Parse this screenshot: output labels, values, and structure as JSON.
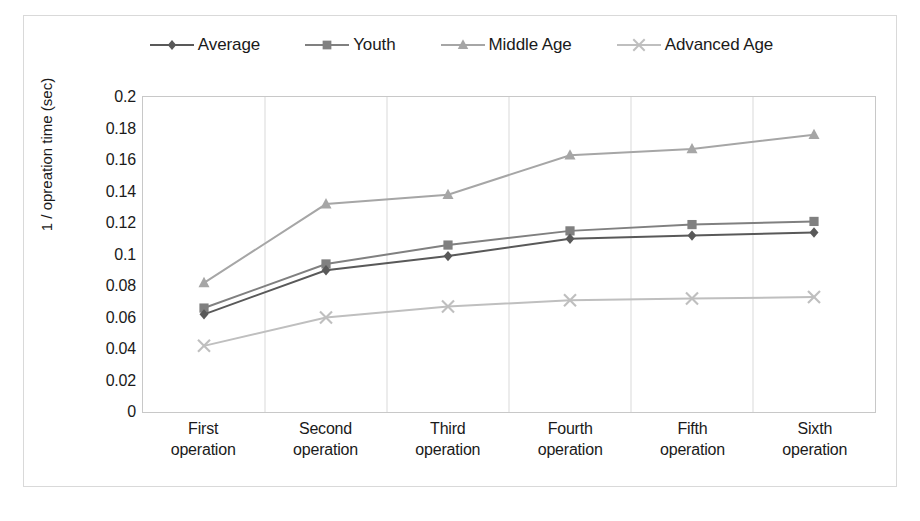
{
  "chart_data": {
    "type": "line",
    "title": "",
    "xlabel": "",
    "ylabel": "1 / opreation time (sec)",
    "categories": [
      "First operation",
      "Second operation",
      "Third operation",
      "Fourth operation",
      "Fifth operation",
      "Sixth operation"
    ],
    "category_lines": [
      [
        "First",
        "operation"
      ],
      [
        "Second",
        "operation"
      ],
      [
        "Third",
        "operation"
      ],
      [
        "Fourth",
        "operation"
      ],
      [
        "Fifth",
        "operation"
      ],
      [
        "Sixth",
        "operation"
      ]
    ],
    "ylim": [
      0,
      0.2
    ],
    "ytick_step": 0.02,
    "ytick_labels": [
      "0.2",
      "0.18",
      "0.16",
      "0.14",
      "0.12",
      "0.1",
      "0.08",
      "0.06",
      "0.04",
      "0.02",
      "0"
    ],
    "ytick_values": [
      0.2,
      0.18,
      0.16,
      0.14,
      0.12,
      0.1,
      0.08,
      0.06,
      0.04,
      0.02,
      0
    ],
    "grid": {
      "vertical": true,
      "horizontal": false
    },
    "legend_position": "top",
    "series": [
      {
        "name": "Average",
        "marker": "diamond",
        "color": "#595959",
        "values": [
          0.062,
          0.09,
          0.099,
          0.11,
          0.112,
          0.114
        ]
      },
      {
        "name": "Youth",
        "marker": "square",
        "color": "#808080",
        "values": [
          0.066,
          0.094,
          0.106,
          0.115,
          0.119,
          0.121
        ]
      },
      {
        "name": "Middle Age",
        "marker": "triangle",
        "color": "#a6a6a6",
        "values": [
          0.082,
          0.132,
          0.138,
          0.163,
          0.167,
          0.176
        ]
      },
      {
        "name": "Advanced Age",
        "marker": "cross",
        "color": "#bfbfbf",
        "values": [
          0.042,
          0.06,
          0.067,
          0.071,
          0.072,
          0.073
        ]
      }
    ]
  }
}
